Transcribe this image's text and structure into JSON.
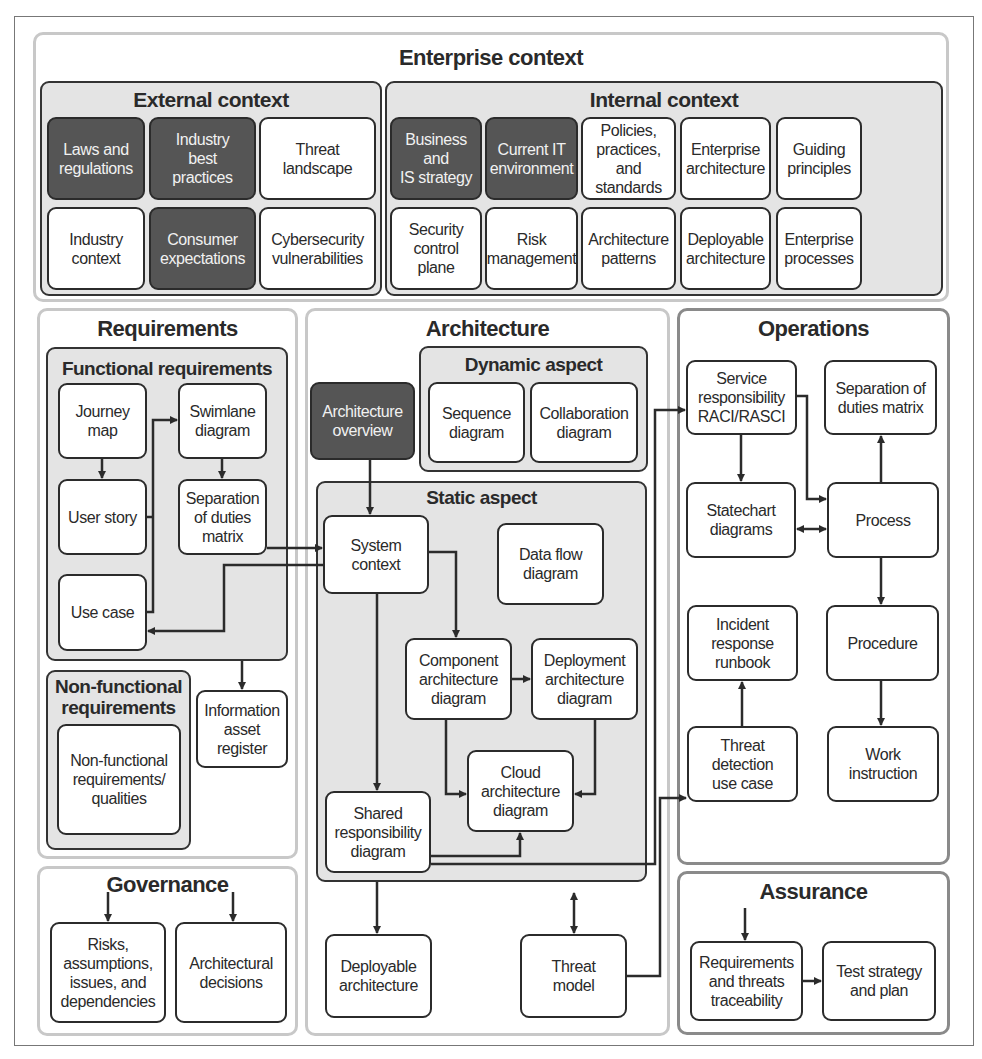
{
  "enterprise": {
    "title": "Enterprise context",
    "external": {
      "title": "External context",
      "items": [
        {
          "label": "Laws and\nregulations",
          "dark": true
        },
        {
          "label": "Industry\nbest\npractices",
          "dark": true
        },
        {
          "label": "Threat\nlandscape",
          "dark": false
        },
        {
          "label": "Industry\ncontext",
          "dark": false
        },
        {
          "label": "Consumer\nexpectations",
          "dark": true
        },
        {
          "label": "Cybersecurity\nvulnerabilities",
          "dark": false
        }
      ]
    },
    "internal": {
      "title": "Internal context",
      "items": [
        {
          "label": "Business and\nIS strategy",
          "dark": true
        },
        {
          "label": "Current IT\nenvironment",
          "dark": true
        },
        {
          "label": "Policies,\npractices, and\nstandards",
          "dark": false
        },
        {
          "label": "Enterprise\narchitecture",
          "dark": false
        },
        {
          "label": "Guiding\nprinciples",
          "dark": false
        },
        {
          "label": "Security\ncontrol plane",
          "dark": false
        },
        {
          "label": "Risk\nmanagement",
          "dark": false
        },
        {
          "label": "Architecture\npatterns",
          "dark": false
        },
        {
          "label": "Deployable\narchitecture",
          "dark": false
        },
        {
          "label": "Enterprise\nprocesses",
          "dark": false
        }
      ]
    }
  },
  "requirements": {
    "title": "Requirements",
    "functional": {
      "title": "Functional requirements",
      "journey_map": "Journey\nmap",
      "user_story": "User story",
      "use_case": "Use case",
      "swimlane": "Swimlane\ndiagram",
      "sod_matrix": "Separation\nof duties\nmatrix"
    },
    "nonfunctional": {
      "title": "Non-functional\nrequirements",
      "item": "Non-functional\nrequirements/\nqualities"
    },
    "info_asset_register": "Information\nasset\nregister"
  },
  "governance": {
    "title": "Governance",
    "raid": "Risks,\nassumptions,\nissues, and\ndependencies",
    "decisions": "Architectural\ndecisions"
  },
  "architecture": {
    "title": "Architecture",
    "overview": "Architecture\noverview",
    "dynamic": {
      "title": "Dynamic aspect",
      "sequence": "Sequence\ndiagram",
      "collaboration": "Collaboration\ndiagram"
    },
    "static": {
      "title": "Static aspect",
      "system_context": "System\ncontext",
      "data_flow": "Data flow\ndiagram",
      "component": "Component\narchitecture\ndiagram",
      "deployment": "Deployment\narchitecture\ndiagram",
      "cloud": "Cloud\narchitecture\ndiagram",
      "shared_responsibility": "Shared\nresponsibility\ndiagram"
    },
    "deployable": "Deployable\narchitecture",
    "threat_model": "Threat\nmodel"
  },
  "operations": {
    "title": "Operations",
    "raci": "Service\nresponsibility\nRACI/RASCI",
    "sod_matrix": "Separation of\nduties matrix",
    "statechart": "Statechart\ndiagrams",
    "process": "Process",
    "incident_runbook": "Incident\nresponse\nrunbook",
    "procedure": "Procedure",
    "threat_detection": "Threat\ndetection\nuse case",
    "work_instruction": "Work\ninstruction"
  },
  "assurance": {
    "title": "Assurance",
    "traceability": "Requirements\nand threats\ntraceability",
    "test_strategy": "Test strategy\nand plan"
  },
  "colors": {
    "dark_box": "#555555",
    "group_fill": "#e4e4e4",
    "region_border": "#c8c8c8",
    "line": "#2b2b2b"
  }
}
